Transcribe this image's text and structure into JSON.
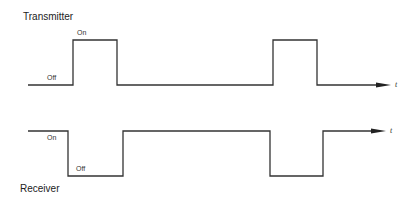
{
  "diagram": {
    "transmitter": {
      "title": "Transmitter",
      "on_label": "On",
      "off_label": "Off",
      "axis_label": "t"
    },
    "receiver": {
      "title": "Receiver",
      "on_label": "On",
      "off_label": "Off",
      "axis_label": "t"
    },
    "line_color": "#333333"
  }
}
